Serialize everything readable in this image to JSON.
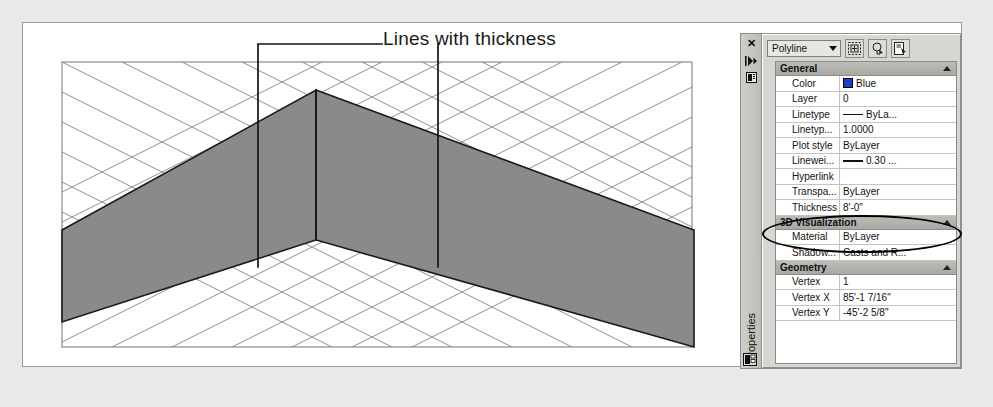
{
  "annotation": {
    "callout_text": "Lines with thickness"
  },
  "palette": {
    "rail": {
      "close_label": "✕",
      "autohide_label": "▸",
      "menu_label": "▤",
      "title": "Properties",
      "bottom_icon": "properties-icon"
    },
    "toolbar": {
      "object_type": "Polyline",
      "buttons": [
        {
          "name": "quick-select-button",
          "label": "⊞"
        },
        {
          "name": "select-objects-button",
          "label": "⌘"
        },
        {
          "name": "pick-point-button",
          "label": "✎"
        }
      ]
    },
    "categories": [
      {
        "name": "General",
        "rows": [
          {
            "label": "Color",
            "value": "Blue",
            "icon": "color-swatch-blue"
          },
          {
            "label": "Layer",
            "value": "0",
            "icon": ""
          },
          {
            "label": "Linetype",
            "value": "ByLa...",
            "icon": "linetype-dash"
          },
          {
            "label": "Linetyp...",
            "value": "1.0000",
            "icon": ""
          },
          {
            "label": "Plot style",
            "value": "ByLayer",
            "icon": ""
          },
          {
            "label": "Linewei...",
            "value": "0.30 ...",
            "icon": "lineweight-dash"
          },
          {
            "label": "Hyperlink",
            "value": "",
            "icon": ""
          },
          {
            "label": "Transpa...",
            "value": "ByLayer",
            "icon": ""
          },
          {
            "label": "Thickness",
            "value": "8'-0\"",
            "icon": ""
          }
        ]
      },
      {
        "name": "3D Visualization",
        "rows": [
          {
            "label": "Material",
            "value": "ByLayer",
            "icon": ""
          },
          {
            "label": "Shadow...",
            "value": "Casts and R...",
            "icon": ""
          }
        ]
      },
      {
        "name": "Geometry",
        "rows": [
          {
            "label": "Vertex",
            "value": "1",
            "icon": ""
          },
          {
            "label": "Vertex X",
            "value": "85'-1 7/16\"",
            "icon": ""
          },
          {
            "label": "Vertex Y",
            "value": "-45'-2 5/8\"",
            "icon": ""
          }
        ]
      }
    ]
  },
  "colors": {
    "page_background": "#e9e9e7",
    "sheet": "#ffffff",
    "wall_fill": "#8a8a8a",
    "grid_line": "#7d7d7d",
    "palette_face": "#d6d6d2",
    "accent_blue": "#1e40c8"
  }
}
